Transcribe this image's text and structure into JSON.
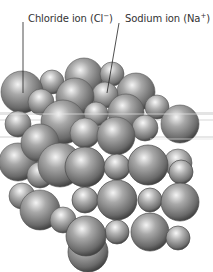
{
  "diagram": {
    "labels": [
      {
        "id": "chloride",
        "text": "Chloride ion (Cl",
        "sup": "−",
        "close": ")"
      },
      {
        "id": "sodium",
        "text": "Sodium ion (Na",
        "sup": "+",
        "close": ")"
      }
    ],
    "colors": {
      "sphere_light": "#f2f2f2",
      "sphere_mid": "#9a9a9a",
      "sphere_dark": "#4a4a4a",
      "leader_line": "#222222",
      "label_text": "#333333"
    }
  }
}
